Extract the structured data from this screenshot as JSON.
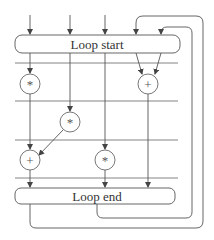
{
  "diagram": {
    "type": "dataflow-loop",
    "loop_start": {
      "label": "Loop start"
    },
    "loop_end": {
      "label": "Loop end"
    },
    "nodes": [
      {
        "id": "n1",
        "op": "*",
        "row": 1,
        "col": 1
      },
      {
        "id": "n2",
        "op": "+",
        "row": 1,
        "col": 4
      },
      {
        "id": "n3",
        "op": "*",
        "row": 2,
        "col": 2
      },
      {
        "id": "n4",
        "op": "+",
        "row": 3,
        "col": 1
      },
      {
        "id": "n5",
        "op": "*",
        "row": 3,
        "col": 3
      }
    ],
    "edges": [
      {
        "from": "input-1",
        "to": "loop_start"
      },
      {
        "from": "input-2",
        "to": "loop_start"
      },
      {
        "from": "input-3",
        "to": "loop_start"
      },
      {
        "from": "loop_start",
        "to": "n1"
      },
      {
        "from": "loop_start",
        "to": "n2"
      },
      {
        "from": "loop_start",
        "to": "n3"
      },
      {
        "from": "loop_start",
        "to": "n5"
      },
      {
        "from": "n1",
        "to": "n4"
      },
      {
        "from": "n3",
        "to": "n4"
      },
      {
        "from": "n4",
        "to": "loop_end"
      },
      {
        "from": "n5",
        "to": "loop_end"
      },
      {
        "from": "n2",
        "to": "loop_end"
      },
      {
        "from": "loop_end",
        "to": "loop_start",
        "kind": "feedback-outer"
      },
      {
        "from": "loop_end",
        "to": "loop_start",
        "kind": "feedback-inner"
      }
    ],
    "colors": {
      "line": "#555555",
      "text": "#333333",
      "background": "#ffffff"
    }
  }
}
